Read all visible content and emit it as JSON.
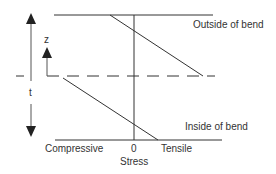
{
  "diagram": {
    "labels": {
      "outside": "Outside of bend",
      "inside": "Inside of bend",
      "z": "z",
      "t": "t",
      "compressive": "Compressive",
      "zero": "0",
      "tensile": "Tensile",
      "stress": "Stress"
    },
    "colors": {
      "line": "#333333",
      "background": "#ffffff"
    }
  }
}
